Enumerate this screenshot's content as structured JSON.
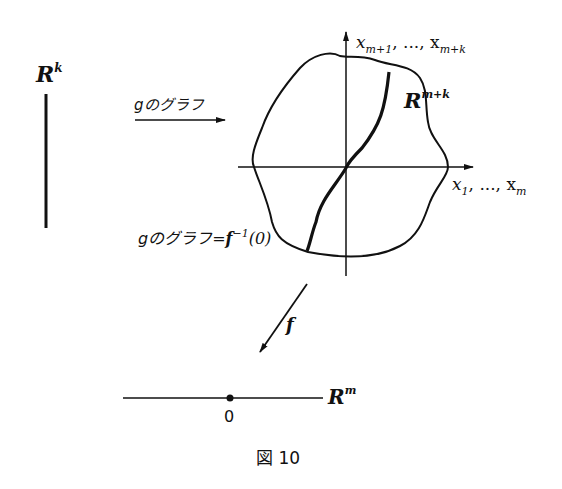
{
  "labels": {
    "rk": "R",
    "rk_sup": "k",
    "rmk": "R",
    "rmk_sup": "m+k",
    "rm": "R",
    "rm_sup": "m",
    "vertical_axis": "x",
    "vertical_axis_sub1": "m+1",
    "vertical_axis_mid": ", ..., x",
    "vertical_axis_sub2": "m+k",
    "horizontal_axis": "x",
    "horizontal_axis_sub1": "1",
    "horizontal_axis_mid": ", ..., x",
    "horizontal_axis_sub2": "m",
    "graph_arrow_label": "gのグラフ",
    "graph_eq_label_pre": "gのグラフ=",
    "graph_eq_label_f": "f",
    "graph_eq_label_sup": "−1",
    "graph_eq_label_post": "(0)",
    "map_label": "f",
    "origin_label": "0",
    "caption": "図 10"
  },
  "colors": {
    "ink": "#111111",
    "background": "#ffffff"
  }
}
